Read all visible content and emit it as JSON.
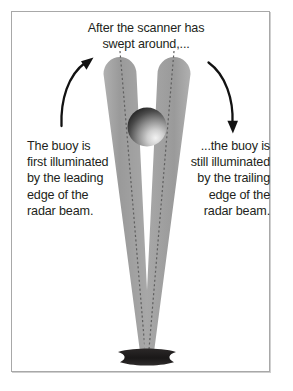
{
  "diagram": {
    "title": "After the scanner has\nswept around,...",
    "left_caption": "The buoy is\nfirst illuminated\nby the leading\nedge of the\nradar beam.",
    "right_caption": "...the buoy is\nstill illuminated\nby the trailing\nedge of the\nradar beam.",
    "elements": {
      "scanner_label": "scanner-sphere",
      "buoy_label": "buoy",
      "left_beam_label": "leading-edge-radar-beam",
      "right_beam_label": "trailing-edge-radar-beam",
      "left_arrow_label": "rotation-arrow-left",
      "right_arrow_label": "rotation-arrow-right",
      "left_centerline_label": "left-beam-centerline",
      "right_centerline_label": "right-beam-centerline"
    },
    "colors": {
      "beam_gray": "#9b9b9b",
      "beam_gray_light": "#b4b4b4",
      "centerline": "#5a5a5a",
      "sphere_dark": "#1c1c1c",
      "sphere_light": "#e8e8e8",
      "buoy": "#211f1f",
      "text": "#231f20",
      "frame": "#a8a8a8",
      "background": "#ffffff",
      "arrow": "#121212"
    },
    "geometry": {
      "sphere_center_x": 147,
      "sphere_center_y": 127,
      "sphere_radius": 19,
      "buoy_center_x": 147,
      "buoy_center_y": 357,
      "canvas_width": 293,
      "canvas_height": 391
    }
  }
}
